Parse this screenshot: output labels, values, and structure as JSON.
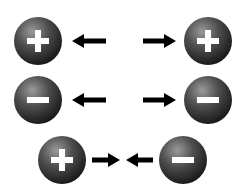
{
  "colors": {
    "sphere_light": "#8a8a8a",
    "sphere_mid": "#4a4a4a",
    "sphere_dark": "#1c1c1c",
    "symbol": "#ffffff",
    "arrow": "#000000",
    "background": "#ffffff"
  },
  "rows": [
    {
      "name": "like-positive-repel",
      "interaction": "repel",
      "left_charge": "positive",
      "right_charge": "negative_false",
      "left_symbol": "+",
      "right_symbol": "+",
      "arrows": [
        "left",
        "right"
      ]
    },
    {
      "name": "like-negative-repel",
      "interaction": "repel",
      "left_symbol": "−",
      "right_symbol": "−",
      "arrows": [
        "left",
        "right"
      ]
    },
    {
      "name": "opposite-attract",
      "interaction": "attract",
      "left_symbol": "+",
      "right_symbol": "−",
      "arrows": [
        "right",
        "left"
      ]
    }
  ]
}
